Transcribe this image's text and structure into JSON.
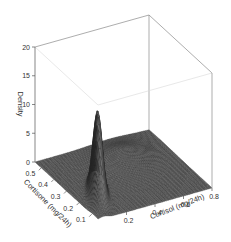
{
  "chart_data": {
    "type": "surface3d",
    "title": "",
    "xlabel": "Cortisol (mg/24h)",
    "ylabel": "Cortisone (mg/24h)",
    "zlabel": "Density",
    "x_ticks": [
      "0.2",
      "0.4",
      "0.6",
      "0.8"
    ],
    "y_ticks": [
      "0.1",
      "0.2",
      "0.3",
      "0.4",
      "0.5"
    ],
    "z_ticks": [
      "0",
      "5",
      "10",
      "15",
      "20"
    ],
    "xlim": [
      0.0,
      0.8
    ],
    "ylim": [
      0.05,
      0.55
    ],
    "zlim": [
      0,
      20
    ],
    "peak": {
      "x": 0.13,
      "y": 0.2,
      "z": 16.5
    },
    "components": [
      {
        "mx": 0.13,
        "my": 0.2,
        "sx": 0.045,
        "sy": 0.055,
        "rho": 0.75,
        "height": 15.0
      },
      {
        "mx": 0.45,
        "my": 0.38,
        "sx": 0.14,
        "sy": 0.09,
        "rho": 0.3,
        "height": 2.2
      }
    ],
    "grid": false,
    "legend": null
  }
}
